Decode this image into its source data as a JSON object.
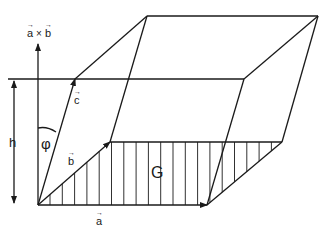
{
  "diagram": {
    "labels": {
      "axis": "a × b",
      "axis_vec_a": "a",
      "axis_cross": "×",
      "axis_vec_b": "b",
      "vector_a": "a",
      "vector_b": "b",
      "vector_c": "c",
      "height": "h",
      "angle": "φ",
      "base_area": "G"
    },
    "vector_arrow_glyph": "→",
    "line_color": "#1a1a1a",
    "background": "#ffffff"
  }
}
